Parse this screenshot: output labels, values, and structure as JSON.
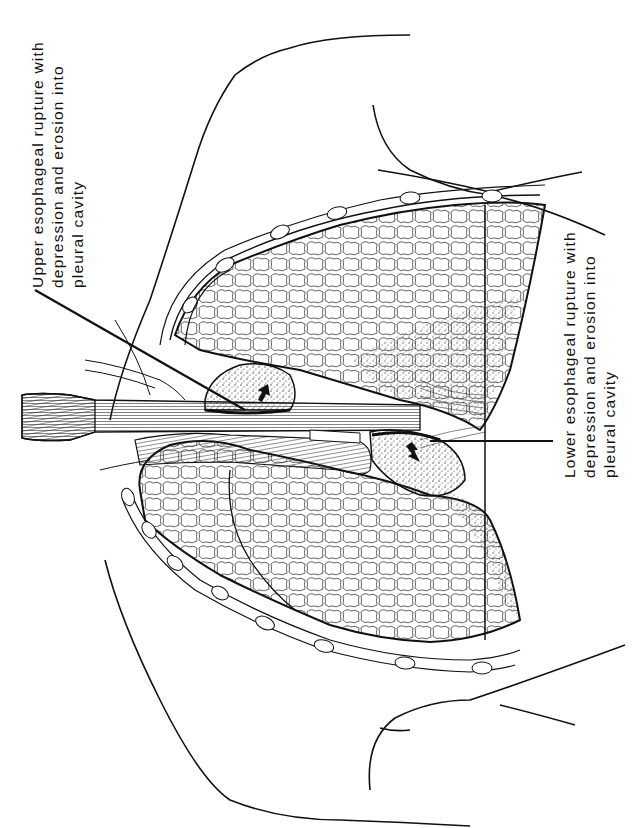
{
  "figure": {
    "type": "anatomical line illustration",
    "colors": {
      "ink": "#111111",
      "background": "#ffffff",
      "stipple": "#555555"
    }
  },
  "labels": {
    "upper": {
      "line1": "Upper esophageal rupture with",
      "line2": "depression and erosion into",
      "line3": "pleural cavity"
    },
    "lower": {
      "line1": "Lower esophageal rupture with",
      "line2": "depression and erosion into",
      "line3": "pleural cavity"
    }
  }
}
